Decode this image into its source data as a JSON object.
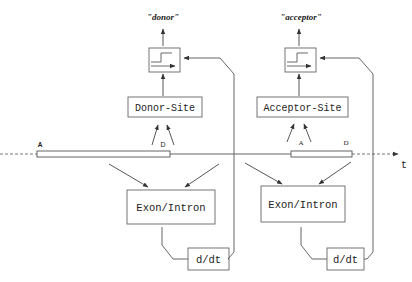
{
  "diagram": {
    "outputs": {
      "donor_label": "\"donor\"",
      "acceptor_label": "\"acceptor\""
    },
    "detectors": {
      "donor_site_label": "Donor-Site",
      "acceptor_site_label": "Acceptor-Site"
    },
    "classifiers": {
      "left_exon_intron_label": "Exon/Intron",
      "right_exon_intron_label": "Exon/Intron"
    },
    "derivatives": {
      "left_label": "d/dt",
      "right_label": "d/dt"
    },
    "sequence": {
      "left_segment": {
        "start_label": "A",
        "end_label": "D"
      },
      "right_segment": {
        "start_label": "A",
        "end_label": "D"
      },
      "axis_label": "t"
    },
    "colors": {
      "line": "#555555",
      "box_border": "#666666",
      "text": "#222222",
      "background": "#ffffff"
    }
  }
}
